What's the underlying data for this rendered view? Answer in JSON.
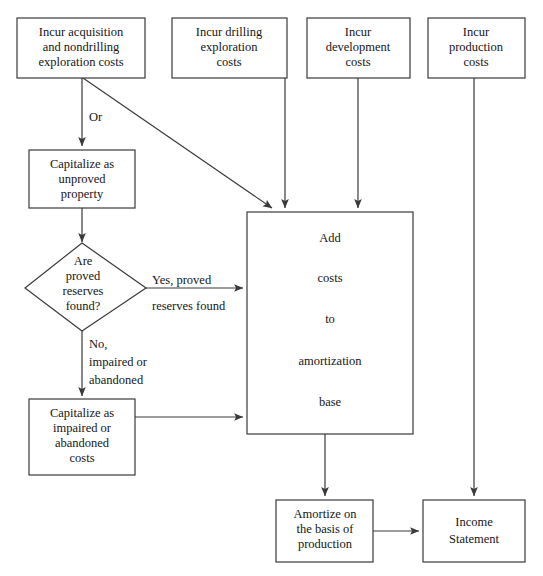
{
  "diagram": {
    "stroke_color": "#3a3a3a",
    "text_color": "#151515",
    "background_color": "#ffffff",
    "nodes": {
      "incur_acquisition": {
        "shape": "rectangle",
        "lines": [
          "Incur acquisition",
          "and nondrilling",
          "exploration costs"
        ]
      },
      "incur_drilling": {
        "shape": "rectangle",
        "lines": [
          "Incur drilling",
          "exploration",
          "costs"
        ]
      },
      "incur_development": {
        "shape": "rectangle",
        "lines": [
          "Incur",
          "development",
          "costs"
        ]
      },
      "incur_production": {
        "shape": "rectangle",
        "lines": [
          "Incur",
          "production",
          "costs"
        ]
      },
      "capitalize_unproved": {
        "shape": "rectangle",
        "lines": [
          "Capitalize as",
          "unproved",
          "property"
        ]
      },
      "proved_reserves_decision": {
        "shape": "diamond",
        "lines": [
          "Are",
          "proved",
          "reserves",
          "found?"
        ]
      },
      "capitalize_impaired": {
        "shape": "rectangle",
        "lines": [
          "Capitalize as",
          "impaired or",
          "abandoned",
          "costs"
        ]
      },
      "amortization_base": {
        "shape": "rectangle",
        "lines": [
          "Add",
          "costs",
          "to",
          "amortization",
          "base"
        ]
      },
      "amortize_production": {
        "shape": "rectangle",
        "lines": [
          "Amortize on",
          "the basis of",
          "production"
        ]
      },
      "income_statement": {
        "shape": "rectangle",
        "lines": [
          "Income",
          "Statement"
        ]
      }
    },
    "edge_labels": {
      "or": [
        "Or"
      ],
      "yes_proved": [
        "Yes, proved",
        "reserves found"
      ],
      "no_impaired": [
        "No,",
        "impaired or",
        "abandoned"
      ]
    }
  }
}
